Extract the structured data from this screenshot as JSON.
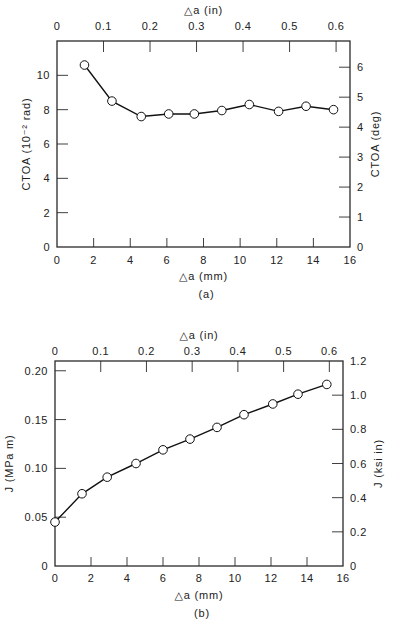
{
  "chart_data": [
    {
      "type": "line",
      "panel_label": "(a)",
      "title": "",
      "xlabel": "△a (mm)",
      "x2label": "△a (in)",
      "ylabel": "CTOA (10⁻² rad)",
      "y2label": "CTOA (deg)",
      "xlim": [
        0,
        16
      ],
      "ylim": [
        0,
        12
      ],
      "x2lim": [
        0,
        0.6299
      ],
      "y2lim": [
        0,
        6.875
      ],
      "xticks": [
        0,
        2,
        4,
        6,
        8,
        10,
        12,
        14,
        16
      ],
      "yticks": [
        0,
        2,
        4,
        6,
        8,
        10
      ],
      "x2ticks": [
        0,
        0.1,
        0.2,
        0.3,
        0.4,
        0.5,
        0.6
      ],
      "x2tick_labels": [
        "0",
        "0.1",
        "0.2",
        "0.3",
        "0.4",
        "0.5",
        "0.6"
      ],
      "y2ticks": [
        0,
        1,
        2,
        3,
        4,
        5,
        6
      ],
      "grid": false,
      "series": [
        {
          "name": "CTOA",
          "marker": "open-circle",
          "x": [
            1.5,
            3.0,
            4.6,
            6.1,
            7.5,
            9.0,
            10.5,
            12.1,
            13.6,
            15.1
          ],
          "y": [
            10.6,
            8.5,
            7.6,
            7.75,
            7.75,
            7.95,
            8.3,
            7.9,
            8.2,
            8.0
          ]
        }
      ]
    },
    {
      "type": "line",
      "panel_label": "(b)",
      "title": "",
      "xlabel": "△a (mm)",
      "x2label": "△a (in)",
      "ylabel": "J (MPa m)",
      "y2label": "J (ksi in)",
      "xlim": [
        0,
        16
      ],
      "ylim": [
        0,
        0.21
      ],
      "x2lim": [
        0,
        0.6299
      ],
      "y2lim": [
        0,
        1.2
      ],
      "xticks": [
        0,
        2,
        4,
        6,
        8,
        10,
        12,
        14,
        16
      ],
      "yticks": [
        0,
        0.05,
        0.1,
        0.15,
        0.2
      ],
      "ytick_labels": [
        "0",
        "0.05",
        "0.10",
        "0.15",
        "0.20"
      ],
      "x2ticks": [
        0,
        0.1,
        0.2,
        0.3,
        0.4,
        0.5,
        0.6
      ],
      "x2tick_labels": [
        "0",
        "0.1",
        "0.2",
        "0.3",
        "0.4",
        "0.5",
        "0.6"
      ],
      "y2ticks": [
        0,
        0.2,
        0.4,
        0.6,
        0.8,
        1.0,
        1.2
      ],
      "y2tick_labels": [
        "0",
        "0.2",
        "0.4",
        "0.6",
        "0.8",
        "1.0",
        "1.2"
      ],
      "grid": false,
      "series": [
        {
          "name": "J",
          "marker": "open-circle",
          "x": [
            0,
            1.5,
            2.9,
            4.5,
            6.0,
            7.5,
            9.0,
            10.5,
            12.1,
            13.5,
            15.1
          ],
          "y": [
            0.045,
            0.074,
            0.091,
            0.105,
            0.119,
            0.13,
            0.142,
            0.155,
            0.166,
            0.176,
            0.186
          ]
        }
      ]
    }
  ],
  "layout": {
    "panels": [
      {
        "left": 57,
        "right": 350,
        "top": 41,
        "bottom": 247,
        "x2_top_label_y": 30,
        "x2_title_y": 14,
        "xtick_label_y": 264,
        "xlabel_y": 280,
        "panel_label_y": 298,
        "ylabel_x": 30,
        "y2label_x": 379
      },
      {
        "left": 55,
        "right": 343,
        "top": 361,
        "bottom": 566,
        "x2_top_label_y": 355,
        "x2_title_y": 339,
        "xtick_label_y": 582,
        "xlabel_y": 599,
        "panel_label_y": 617,
        "ylabel_x": 13,
        "y2label_x": 382
      }
    ]
  }
}
